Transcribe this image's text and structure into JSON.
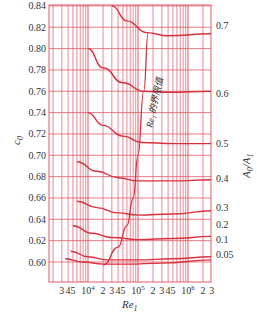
{
  "chart_data": {
    "type": "line",
    "title": "",
    "xlabel": "Re_1",
    "ylabel": "c_0",
    "y2label": "A_0/A_1",
    "xscale": "log",
    "ylim": [
      0.58,
      0.84
    ],
    "xlim": [
      2000,
      3000000
    ],
    "grid": true,
    "y_ticks": [
      "0.84",
      "0.82",
      "0.80",
      "0.78",
      "0.76",
      "0.74",
      "0.72",
      "0.70",
      "0.68",
      "0.66",
      "0.64",
      "0.62",
      "0.60"
    ],
    "y_tick_values": [
      0.84,
      0.82,
      0.8,
      0.78,
      0.76,
      0.74,
      0.72,
      0.7,
      0.68,
      0.66,
      0.64,
      0.62,
      0.6
    ],
    "x_tick_labels": [
      {
        "text": "3",
        "re": 3000
      },
      {
        "text": "4",
        "re": 4000
      },
      {
        "text": "5",
        "re": 5000
      },
      {
        "text": "10⁴",
        "re": 10000
      },
      {
        "text": "2",
        "re": 20000
      },
      {
        "text": "3",
        "re": 30000
      },
      {
        "text": "4",
        "re": 40000
      },
      {
        "text": "5",
        "re": 50000
      },
      {
        "text": "10⁵",
        "re": 100000
      },
      {
        "text": "2",
        "re": 200000
      },
      {
        "text": "3",
        "re": 300000
      },
      {
        "text": "4",
        "re": 400000
      },
      {
        "text": "5",
        "re": 500000
      },
      {
        "text": "10⁶",
        "re": 1000000
      },
      {
        "text": "2",
        "re": 2000000
      },
      {
        "text": "3",
        "re": 3000000
      }
    ],
    "series": [
      {
        "name": "0.7",
        "label_y": 0.822,
        "points": [
          [
            30000,
            0.84
          ],
          [
            60000,
            0.826
          ],
          [
            150000,
            0.815
          ],
          [
            400000,
            0.812
          ],
          [
            3000000,
            0.814
          ]
        ]
      },
      {
        "name": "0.6",
        "label_y": 0.758,
        "points": [
          [
            10000,
            0.8
          ],
          [
            20000,
            0.782
          ],
          [
            50000,
            0.768
          ],
          [
            130000,
            0.76
          ],
          [
            400000,
            0.759
          ],
          [
            3000000,
            0.76
          ]
        ]
      },
      {
        "name": "0.5",
        "label_y": 0.711,
        "points": [
          [
            10000,
            0.74
          ],
          [
            20000,
            0.728
          ],
          [
            50000,
            0.718
          ],
          [
            120000,
            0.712
          ],
          [
            500000,
            0.711
          ],
          [
            3000000,
            0.711
          ]
        ]
      },
      {
        "name": "0.4",
        "label_y": 0.678,
        "points": [
          [
            6000,
            0.694
          ],
          [
            15000,
            0.685
          ],
          [
            40000,
            0.679
          ],
          [
            100000,
            0.676
          ],
          [
            500000,
            0.676
          ],
          [
            3000000,
            0.677
          ]
        ]
      },
      {
        "name": "0.3",
        "label_y": 0.651,
        "points": [
          [
            6000,
            0.657
          ],
          [
            15000,
            0.651
          ],
          [
            40000,
            0.646
          ],
          [
            100000,
            0.644
          ],
          [
            500000,
            0.645
          ],
          [
            3000000,
            0.648
          ]
        ]
      },
      {
        "name": "0.2",
        "label_y": 0.635,
        "points": [
          [
            5000,
            0.634
          ],
          [
            12000,
            0.627
          ],
          [
            30000,
            0.623
          ],
          [
            100000,
            0.621
          ],
          [
            500000,
            0.622
          ],
          [
            3000000,
            0.624
          ]
        ]
      },
      {
        "name": "0.1",
        "label_y": 0.621,
        "points": [
          [
            4500,
            0.61
          ],
          [
            10000,
            0.605
          ],
          [
            25000,
            0.602
          ],
          [
            100000,
            0.602
          ],
          [
            500000,
            0.603
          ],
          [
            3000000,
            0.605
          ]
        ]
      },
      {
        "name": "0.05",
        "label_y": 0.607,
        "points": [
          [
            3500,
            0.603
          ],
          [
            8000,
            0.6
          ],
          [
            20000,
            0.598
          ],
          [
            60000,
            0.598
          ],
          [
            300000,
            0.599
          ],
          [
            3000000,
            0.602
          ]
        ]
      }
    ],
    "critical_curve": {
      "label": "Re₁ 的界限值",
      "points": [
        [
          20000,
          0.597
        ],
        [
          40000,
          0.614
        ],
        [
          60000,
          0.634
        ],
        [
          80000,
          0.66
        ],
        [
          100000,
          0.7
        ],
        [
          130000,
          0.76
        ],
        [
          160000,
          0.815
        ]
      ]
    }
  },
  "axes": {
    "y_left_label": "c",
    "y_left_label_sub": "0",
    "y_right_label": "A",
    "y_right_label_sub1": "0",
    "y_right_label_mid": "/A",
    "y_right_label_sub2": "1",
    "x_label": "Re",
    "x_label_sub": "1"
  },
  "colors": {
    "grid": "#e05a6a",
    "curve": "#d9303f",
    "text": "#333333",
    "frame": "#e05a6a"
  }
}
